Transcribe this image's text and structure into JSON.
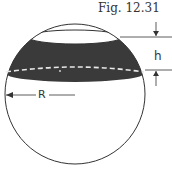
{
  "figure": {
    "caption": "Fig. 12.31",
    "labels": {
      "height": "h",
      "radius": "R"
    },
    "colors": {
      "band": "#3a3a3a",
      "line": "#333333",
      "dashed": "#e8e8e8"
    }
  }
}
